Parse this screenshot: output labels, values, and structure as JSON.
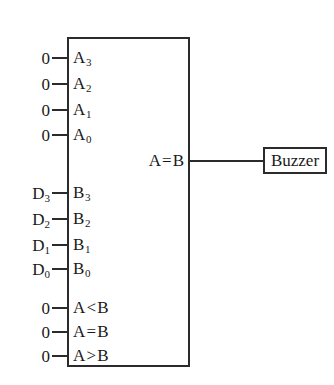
{
  "diagram": {
    "colors": {
      "line": "#2b2b2b",
      "text": "#1a1a1a",
      "background": "#ffffff"
    },
    "comparator": {
      "a_inputs": [
        {
          "pin": "A",
          "subscript": "3",
          "source": "0"
        },
        {
          "pin": "A",
          "subscript": "2",
          "source": "0"
        },
        {
          "pin": "A",
          "subscript": "1",
          "source": "0"
        },
        {
          "pin": "A",
          "subscript": "0",
          "source": "0"
        }
      ],
      "b_inputs": [
        {
          "pin": "B",
          "subscript": "3",
          "source": "D",
          "source_subscript": "3"
        },
        {
          "pin": "B",
          "subscript": "2",
          "source": "D",
          "source_subscript": "2"
        },
        {
          "pin": "B",
          "subscript": "1",
          "source": "D",
          "source_subscript": "1"
        },
        {
          "pin": "B",
          "subscript": "0",
          "source": "D",
          "source_subscript": "0"
        }
      ],
      "cascade_inputs": [
        {
          "operand_a": "A",
          "operator": "<",
          "operand_b": "B",
          "source": "0"
        },
        {
          "operand_a": "A",
          "operator": "=",
          "operand_b": "B",
          "source": "0"
        },
        {
          "operand_a": "A",
          "operator": ">",
          "operand_b": "B",
          "source": "0"
        }
      ],
      "output": {
        "operand_a": "A",
        "operator": "=",
        "operand_b": "B"
      }
    },
    "buzzer": {
      "label": "Buzzer"
    }
  }
}
